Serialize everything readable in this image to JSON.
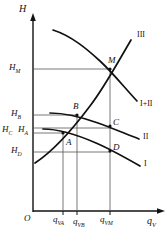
{
  "figure": {
    "axes": {
      "y_label": "H",
      "x_label": "q",
      "x_label_sub": "V",
      "origin_label": "O"
    },
    "y_ticks": [
      {
        "id": "HM",
        "base": "H",
        "sub": "M",
        "y_px": 69
      },
      {
        "id": "HB",
        "base": "H",
        "sub": "B",
        "y_px": 115
      },
      {
        "id": "HC",
        "base": "H",
        "sub": "C",
        "y_px": 131
      },
      {
        "id": "HA",
        "base": "H",
        "sub": "A",
        "y_px": 133
      },
      {
        "id": "HD",
        "base": "H",
        "sub": "D",
        "y_px": 152
      }
    ],
    "x_ticks": [
      {
        "id": "qVA",
        "base": "q",
        "sub": "VA",
        "x_px": 63
      },
      {
        "id": "qVB",
        "base": "q",
        "sub": "VB",
        "x_px": 77
      },
      {
        "id": "qVM",
        "base": "q",
        "sub": "VM",
        "x_px": 110
      }
    ],
    "points": [
      {
        "name": "M",
        "x_px": 110,
        "y_px": 69
      },
      {
        "name": "B",
        "x_px": 77,
        "y_px": 115
      },
      {
        "name": "C",
        "x_px": 110,
        "y_px": 126
      },
      {
        "name": "A",
        "x_px": 63,
        "y_px": 133
      },
      {
        "name": "D",
        "x_px": 110,
        "y_px": 151
      }
    ],
    "curve_labels": [
      {
        "id": "III",
        "text": "III",
        "x_px": 140,
        "y_px": 36
      },
      {
        "id": "I+II",
        "text": "I+II",
        "x_px": 142,
        "y_px": 105
      },
      {
        "id": "II",
        "text": "II",
        "x_px": 145,
        "y_px": 138
      },
      {
        "id": "I",
        "text": "I",
        "x_px": 146,
        "y_px": 165
      }
    ],
    "colors": {
      "ink": "#111111",
      "grid": "#555555",
      "background": "#ffffff"
    }
  }
}
